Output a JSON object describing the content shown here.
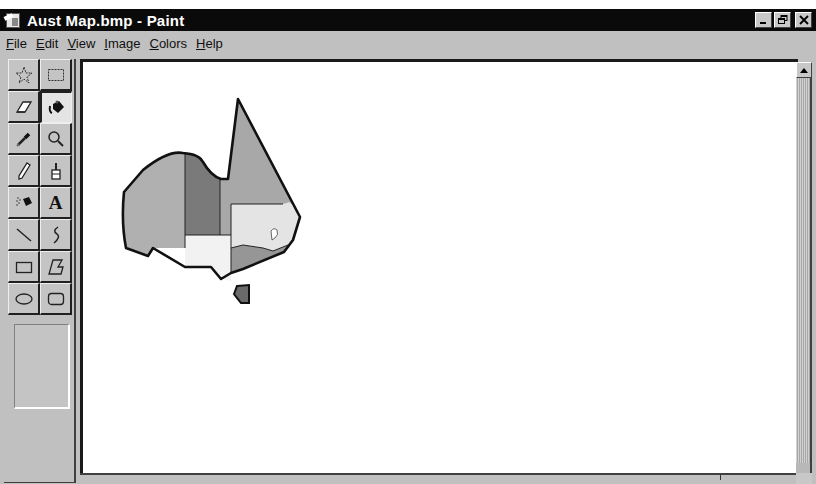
{
  "window": {
    "title": "Aust Map.bmp - Paint",
    "app_icon": "paint-app-icon",
    "controls": {
      "minimize": "_",
      "restore": "ᶑ",
      "close": "✕"
    }
  },
  "menubar": {
    "items": [
      {
        "accel": "F",
        "rest": "ile",
        "label": "File"
      },
      {
        "accel": "E",
        "rest": "dit",
        "label": "Edit"
      },
      {
        "accel": "V",
        "rest": "iew",
        "label": "View"
      },
      {
        "accel": "I",
        "rest": "mage",
        "label": "Image"
      },
      {
        "accel": "C",
        "rest": "olors",
        "label": "Colors"
      },
      {
        "accel": "H",
        "rest": "elp",
        "label": "Help"
      }
    ]
  },
  "toolbox": {
    "tools": [
      {
        "name": "free-form-select",
        "icon": "star-select-icon"
      },
      {
        "name": "select",
        "icon": "rect-select-icon"
      },
      {
        "name": "eraser",
        "icon": "eraser-icon"
      },
      {
        "name": "fill-with-color",
        "icon": "paint-bucket-icon",
        "active": true
      },
      {
        "name": "pick-color",
        "icon": "eyedropper-icon"
      },
      {
        "name": "magnifier",
        "icon": "magnifier-icon"
      },
      {
        "name": "pencil",
        "icon": "pencil-icon"
      },
      {
        "name": "brush",
        "icon": "brush-icon"
      },
      {
        "name": "airbrush",
        "icon": "airbrush-icon"
      },
      {
        "name": "text",
        "icon": "text-icon",
        "glyph": "A"
      },
      {
        "name": "line",
        "icon": "line-icon"
      },
      {
        "name": "curve",
        "icon": "curve-icon"
      },
      {
        "name": "rectangle",
        "icon": "rectangle-icon"
      },
      {
        "name": "polygon",
        "icon": "polygon-icon"
      },
      {
        "name": "ellipse",
        "icon": "ellipse-icon"
      },
      {
        "name": "rounded-rectangle",
        "icon": "rounded-rectangle-icon"
      }
    ]
  },
  "canvas": {
    "image": "Australia state map",
    "regions": [
      {
        "name": "western-australia",
        "fill": "#b4b4b4"
      },
      {
        "name": "northern-territory",
        "fill": "#7e7e7e"
      },
      {
        "name": "queensland",
        "fill": "#aaaaaa"
      },
      {
        "name": "south-australia",
        "fill": "#f2f2f2"
      },
      {
        "name": "new-south-wales",
        "fill": "#e6e6e6"
      },
      {
        "name": "act",
        "fill": "#ffffff"
      },
      {
        "name": "victoria",
        "fill": "#9a9a9a"
      },
      {
        "name": "tasmania",
        "fill": "#6a6a6a"
      }
    ]
  },
  "scrollbar": {
    "up_arrow": "scroll-up-arrow"
  }
}
